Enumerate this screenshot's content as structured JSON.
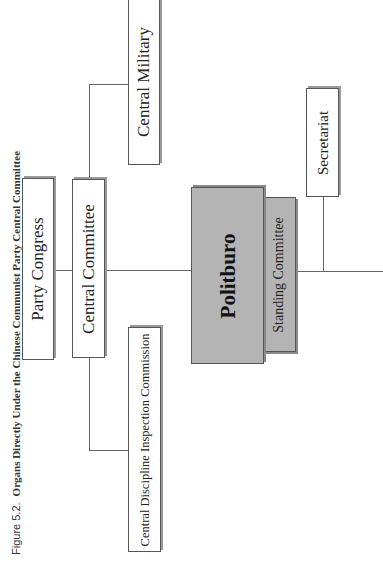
{
  "caption": {
    "label": "Figure 5.2.",
    "title": "Organs Directly Under the Chinese Communist Party Central Committee"
  },
  "nodes": {
    "party_congress": "Party Congress",
    "central_committee": "Central Committee",
    "central_military": "Central Military",
    "cdic": "Central Discipline Inspection Commission",
    "politburo": "Politburo",
    "standing_committee": "Standing Committee",
    "secretariat": "Secretariat"
  },
  "colors": {
    "box_fill": "#ffffff",
    "politburo_fill": "#b4b4b4",
    "line": "#666666"
  }
}
